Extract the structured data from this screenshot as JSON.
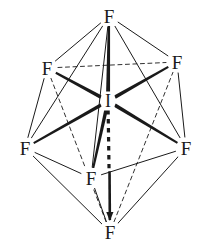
{
  "figure": {
    "name": "iodine-heptafluoride-structure",
    "background_color": "#ffffff",
    "line_color": "#1a1a1a",
    "label_color": "#1a1a1a",
    "width": 205,
    "height": 249
  },
  "chart_data": {
    "type": "diagram",
    "geometry": "pentagonal bipyramidal",
    "center_atom": "I",
    "ligand_atom": "F",
    "ligand_count": 7,
    "axial_count": 2,
    "equatorial_count": 5,
    "atoms": [
      {
        "id": "I",
        "label": "I",
        "role": "center",
        "x": 108,
        "y": 101,
        "font_size": 18
      },
      {
        "id": "F1",
        "label": "F",
        "role": "axial-top",
        "x": 109,
        "y": 16,
        "font_size": 19
      },
      {
        "id": "F2",
        "label": "F",
        "role": "equatorial-back-left",
        "x": 47,
        "y": 68,
        "font_size": 19
      },
      {
        "id": "F3",
        "label": "F",
        "role": "equatorial-back-right",
        "x": 177,
        "y": 62,
        "font_size": 19
      },
      {
        "id": "F4",
        "label": "F",
        "role": "equatorial-left",
        "x": 25,
        "y": 148,
        "font_size": 19
      },
      {
        "id": "F5",
        "label": "F",
        "role": "equatorial-right",
        "x": 186,
        "y": 148,
        "font_size": 19
      },
      {
        "id": "F6",
        "label": "F",
        "role": "equatorial-front",
        "x": 91,
        "y": 178,
        "font_size": 19
      },
      {
        "id": "F7",
        "label": "F",
        "role": "axial-bottom",
        "x": 110,
        "y": 232,
        "font_size": 19
      }
    ],
    "bonds": [
      {
        "from": "I",
        "to": "F1",
        "style": "bold",
        "width": 4.0,
        "name": "bond-I-F-axial-top"
      },
      {
        "from": "I",
        "to": "F7",
        "style": "dashed-then-bold",
        "width": 3.6,
        "name": "bond-I-F-axial-bottom"
      },
      {
        "from": "I",
        "to": "F2",
        "style": "bold",
        "width": 3.6,
        "name": "bond-I-F-equatorial-back-left"
      },
      {
        "from": "I",
        "to": "F3",
        "style": "bold",
        "width": 3.6,
        "name": "bond-I-F-equatorial-back-right"
      },
      {
        "from": "I",
        "to": "F4",
        "style": "bold",
        "width": 3.6,
        "name": "bond-I-F-equatorial-left"
      },
      {
        "from": "I",
        "to": "F5",
        "style": "bold",
        "width": 3.6,
        "name": "bond-I-F-equatorial-right"
      },
      {
        "from": "I",
        "to": "F6",
        "style": "bold",
        "width": 3.6,
        "name": "bond-I-F-equatorial-front"
      }
    ],
    "cage_edges": [
      {
        "from": "F1",
        "to": "F2",
        "style": "thin",
        "name": "edge-top-to-back-left"
      },
      {
        "from": "F1",
        "to": "F3",
        "style": "thin",
        "name": "edge-top-to-back-right"
      },
      {
        "from": "F1",
        "to": "F4",
        "style": "thin",
        "name": "edge-top-to-left"
      },
      {
        "from": "F1",
        "to": "F5",
        "style": "thin",
        "name": "edge-top-to-right"
      },
      {
        "from": "F1",
        "to": "F6",
        "style": "thin",
        "name": "edge-top-to-front"
      },
      {
        "from": "F7",
        "to": "F4",
        "style": "thin",
        "name": "edge-bottom-to-left"
      },
      {
        "from": "F7",
        "to": "F5",
        "style": "thin",
        "name": "edge-bottom-to-right"
      },
      {
        "from": "F7",
        "to": "F6",
        "style": "thin",
        "name": "edge-bottom-to-front"
      },
      {
        "from": "F7",
        "to": "F2",
        "style": "dashed",
        "name": "edge-bottom-to-back-left-hidden"
      },
      {
        "from": "F7",
        "to": "F3",
        "style": "dashed",
        "name": "edge-bottom-to-back-right-hidden"
      },
      {
        "from": "F2",
        "to": "F3",
        "style": "dashed",
        "name": "edge-back-left-to-back-right-hidden"
      },
      {
        "from": "F2",
        "to": "F4",
        "style": "thin",
        "name": "edge-back-left-to-left"
      },
      {
        "from": "F3",
        "to": "F5",
        "style": "thin",
        "name": "edge-back-right-to-right"
      },
      {
        "from": "F4",
        "to": "F6",
        "style": "thin",
        "name": "edge-left-to-front"
      },
      {
        "from": "F5",
        "to": "F6",
        "style": "thin",
        "name": "edge-right-to-front"
      }
    ]
  }
}
